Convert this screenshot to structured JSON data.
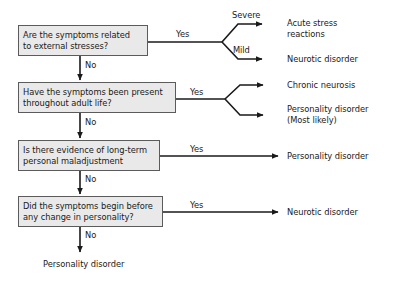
{
  "diagram": {
    "stroke_color": "#1a1a1a",
    "box_fill": "#e9e9e9",
    "box_border": "#5b5b5b",
    "background": "#ffffff"
  },
  "questions": [
    {
      "id": "q1",
      "line1": "Are the symptoms related",
      "line2": "to external stresses?"
    },
    {
      "id": "q2",
      "line1": "Have the symptoms been present",
      "line2": "throughout adult life?"
    },
    {
      "id": "q3",
      "line1": "Is there evidence of long-term",
      "line2": "personal maladjustment"
    },
    {
      "id": "q4",
      "line1": "Did the symptoms begin before",
      "line2": "any change in personality?"
    }
  ],
  "edge_labels": {
    "yes1": "Yes",
    "yes2": "Yes",
    "yes3": "Yes",
    "yes4": "Yes",
    "no1": "No",
    "no2": "No",
    "no3": "No",
    "no4": "No",
    "severe": "Severe",
    "mild": "Mild"
  },
  "outcomes": [
    {
      "id": "o1",
      "line1": "Acute stress",
      "line2": "reactions"
    },
    {
      "id": "o2",
      "line1": "Neurotic disorder",
      "line2": ""
    },
    {
      "id": "o3",
      "line1": "Chronic neurosis",
      "line2": ""
    },
    {
      "id": "o4",
      "line1": "Personality disorder",
      "line2": "(Most likely)"
    },
    {
      "id": "o5",
      "line1": "Personality disorder",
      "line2": ""
    },
    {
      "id": "o6",
      "line1": "Neurotic disorder",
      "line2": ""
    },
    {
      "id": "o7",
      "line1": "Personality disorder",
      "line2": ""
    }
  ]
}
